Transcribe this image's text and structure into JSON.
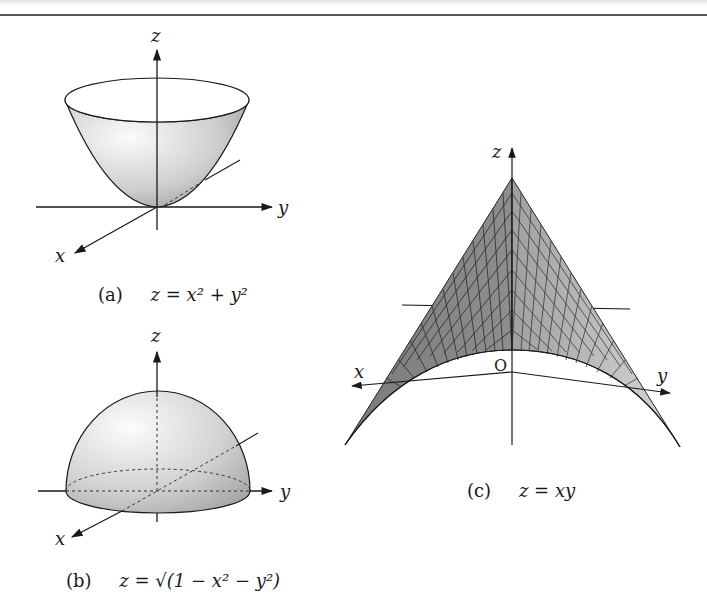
{
  "figures": {
    "a": {
      "label": "(a)",
      "equation_lhs": "z =",
      "equation_rhs": "x² + y²",
      "axes": {
        "x": "x",
        "y": "y",
        "z": "z"
      },
      "surface": "paraboloid"
    },
    "b": {
      "label": "(b)",
      "equation_lhs": "z =",
      "equation_rhs": "√(1 − x² − y²)",
      "axes": {
        "x": "x",
        "y": "y",
        "z": "z"
      },
      "surface": "upper hemisphere"
    },
    "c": {
      "label": "(c)",
      "equation_lhs": "z =",
      "equation_rhs": "xy",
      "axes": {
        "x": "x",
        "y": "y",
        "z": "z"
      },
      "origin": "O",
      "surface": "hyperbolic paraboloid (saddle)"
    }
  },
  "colors": {
    "ink": "#1a1a1a",
    "surface_light": "#f2f2f2",
    "surface_mid": "#c8c8c8",
    "surface_dark": "#8a8a8a",
    "grid": "#333333"
  }
}
